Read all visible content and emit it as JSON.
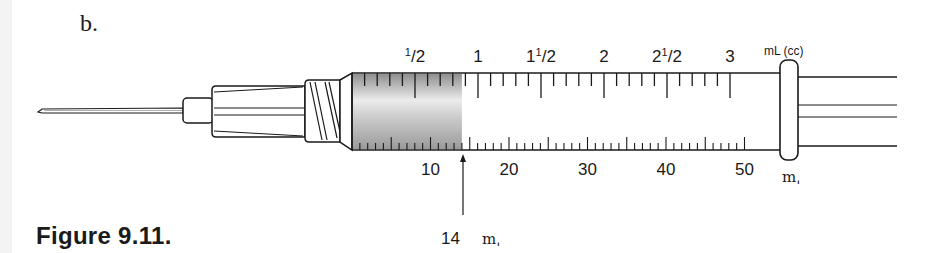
{
  "panel_label": "b.",
  "caption": "Figure 9.11.",
  "syringe": {
    "type": "3 mL syringe with dual mL (cc) and minim scales",
    "top_scale": {
      "unit_label": "mL (cc)",
      "labels": [
        {
          "text_whole": "",
          "text_frac": "1/2",
          "value": 0.5
        },
        {
          "text_whole": "1",
          "text_frac": "",
          "value": 1
        },
        {
          "text_whole": "1",
          "text_frac": "1/2",
          "value": 1.5
        },
        {
          "text_whole": "2",
          "text_frac": "",
          "value": 2
        },
        {
          "text_whole": "2",
          "text_frac": "1/2",
          "value": 2.5
        },
        {
          "text_whole": "3",
          "text_frac": "",
          "value": 3
        }
      ],
      "minor_step": 0.1,
      "max": 3
    },
    "bottom_scale": {
      "unit_symbol": "mˌ",
      "labels": [
        "10",
        "20",
        "30",
        "40",
        "50"
      ],
      "minor_step": 1,
      "max": 50
    },
    "fill": {
      "amount_minims": 14,
      "annotation_value": "14",
      "annotation_unit": "mˌ",
      "color_dark": "#9a9a9a",
      "color_light": "#e6e6e6"
    }
  },
  "colors": {
    "line": "#1a1a1a",
    "background": "#ffffff"
  }
}
